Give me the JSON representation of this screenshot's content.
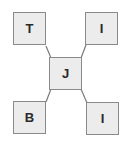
{
  "diagram": {
    "type": "star",
    "center": {
      "label": "J"
    },
    "nodes": [
      {
        "label": "T",
        "position": "top-left"
      },
      {
        "label": "I",
        "position": "top-right"
      },
      {
        "label": "B",
        "position": "bottom-left"
      },
      {
        "label": "I",
        "position": "bottom-right"
      }
    ],
    "colors": {
      "box_fill": "#ececec",
      "box_border": "#8a8a8a",
      "connector": "#7a7a7a",
      "text": "#2a2a2a"
    }
  }
}
